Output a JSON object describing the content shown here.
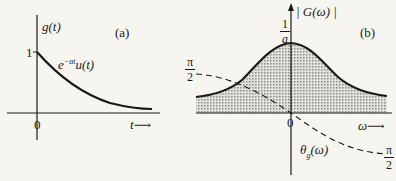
{
  "panel_a": {
    "tag": "(a)",
    "y_axis_label": "g(t)",
    "x_axis_label": "t",
    "curve_label": "e^{-at}u(t)",
    "curve_label_base": "e",
    "curve_label_sup": "−at",
    "curve_label_rest": "u(t)",
    "y_tick": "1",
    "origin": "0",
    "arrow": "⟶"
  },
  "panel_b": {
    "tag": "(b)",
    "y_axis_label": "| G(ω) |",
    "x_axis_label": "ω",
    "peak_label_num": "1",
    "peak_label_den": "a",
    "left_phase_num": "π",
    "left_phase_den": "2",
    "right_phase_num": "π",
    "right_phase_den": "2",
    "phase_label": "θ",
    "phase_label_sub": "g",
    "phase_label_rest": "(ω)",
    "origin": "0",
    "arrow": "⟶"
  },
  "colors": {
    "ink": "#1a1a1a",
    "background": "#f6f5ef",
    "shade": "#c9c9c4"
  }
}
